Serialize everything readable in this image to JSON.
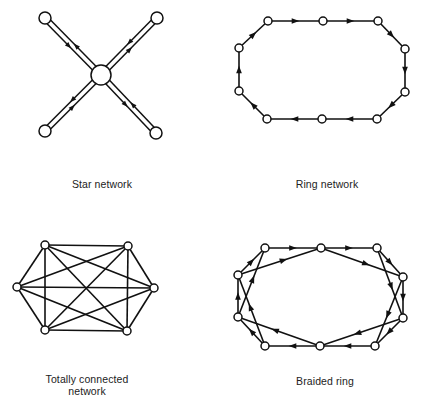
{
  "colors": {
    "line": "#111111",
    "node_fill": "#ffffff",
    "background": "#ffffff"
  },
  "diagrams": [
    {
      "id": "star",
      "label": "Star network",
      "label_pos": {
        "x": 102,
        "y": 178
      },
      "hub": {
        "x": 101,
        "y": 75,
        "r": 10
      },
      "nodes": [
        {
          "x": 45,
          "y": 18,
          "r": 6
        },
        {
          "x": 157,
          "y": 18,
          "r": 6
        },
        {
          "x": 45,
          "y": 131,
          "r": 6
        },
        {
          "x": 156,
          "y": 133,
          "r": 6
        }
      ]
    },
    {
      "id": "ring",
      "label": "Ring network",
      "label_pos": {
        "x": 327,
        "y": 178
      },
      "nodes": [
        {
          "x": 268,
          "y": 21
        },
        {
          "x": 323,
          "y": 21
        },
        {
          "x": 378,
          "y": 21
        },
        {
          "x": 405,
          "y": 49
        },
        {
          "x": 405,
          "y": 92
        },
        {
          "x": 377,
          "y": 119
        },
        {
          "x": 322,
          "y": 119
        },
        {
          "x": 267,
          "y": 119
        },
        {
          "x": 239,
          "y": 91
        },
        {
          "x": 239,
          "y": 48
        }
      ],
      "edges": [
        [
          0,
          1
        ],
        [
          1,
          2
        ],
        [
          2,
          3
        ],
        [
          3,
          4
        ],
        [
          4,
          5
        ],
        [
          5,
          6
        ],
        [
          6,
          7
        ],
        [
          7,
          8
        ],
        [
          8,
          9
        ],
        [
          9,
          0
        ]
      ]
    },
    {
      "id": "totally-connected",
      "label": "Totally connected",
      "label2": "network",
      "label_pos": {
        "x": 87,
        "y": 373
      },
      "nodes": [
        {
          "x": 45,
          "y": 245
        },
        {
          "x": 128,
          "y": 246
        },
        {
          "x": 154,
          "y": 288
        },
        {
          "x": 127,
          "y": 331
        },
        {
          "x": 45,
          "y": 330
        },
        {
          "x": 17,
          "y": 287
        }
      ]
    },
    {
      "id": "braided-ring",
      "label": "Braided ring",
      "label_pos": {
        "x": 325,
        "y": 375
      },
      "nodes": [
        {
          "x": 265,
          "y": 248
        },
        {
          "x": 321,
          "y": 248
        },
        {
          "x": 377,
          "y": 248
        },
        {
          "x": 403,
          "y": 277
        },
        {
          "x": 403,
          "y": 318
        },
        {
          "x": 375,
          "y": 346
        },
        {
          "x": 320,
          "y": 346
        },
        {
          "x": 265,
          "y": 346
        },
        {
          "x": 238,
          "y": 317
        },
        {
          "x": 238,
          "y": 275
        }
      ],
      "edges": [
        [
          0,
          1
        ],
        [
          1,
          2
        ],
        [
          2,
          3
        ],
        [
          3,
          4
        ],
        [
          4,
          5
        ],
        [
          5,
          6
        ],
        [
          6,
          7
        ],
        [
          7,
          8
        ],
        [
          8,
          9
        ],
        [
          9,
          0
        ],
        [
          9,
          1
        ],
        [
          1,
          3
        ],
        [
          2,
          4
        ],
        [
          3,
          5
        ],
        [
          4,
          6
        ],
        [
          6,
          8
        ],
        [
          7,
          9
        ],
        [
          8,
          0
        ]
      ]
    }
  ]
}
